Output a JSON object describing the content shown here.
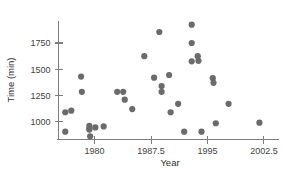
{
  "chart_data": {
    "type": "scatter",
    "title": "",
    "xlabel": "Year",
    "ylabel": "Time (min)",
    "xlim": [
      1975.2,
      2004.5
    ],
    "ylim": [
      830,
      1960
    ],
    "xticks": [
      1980,
      1987.5,
      1995,
      2002.5
    ],
    "xticklabels": [
      "1980",
      "1987.5",
      "1995",
      "2002.5"
    ],
    "yticks": [
      1000,
      1250,
      1500,
      1750
    ],
    "yticklabels": [
      "1000",
      "1250",
      "1500",
      "1750"
    ],
    "grid": false,
    "legend": null,
    "marker": {
      "shape": "circle",
      "color": "#6b6b6b",
      "size": 3.1
    },
    "points": [
      {
        "x": 1976.1,
        "y": 1090
      },
      {
        "x": 1976.1,
        "y": 905
      },
      {
        "x": 1976.9,
        "y": 1105
      },
      {
        "x": 1978.2,
        "y": 1430
      },
      {
        "x": 1978.3,
        "y": 1285
      },
      {
        "x": 1979.3,
        "y": 960
      },
      {
        "x": 1979.3,
        "y": 935
      },
      {
        "x": 1979.3,
        "y": 925
      },
      {
        "x": 1979.4,
        "y": 860
      },
      {
        "x": 1980.1,
        "y": 945
      },
      {
        "x": 1981.2,
        "y": 955
      },
      {
        "x": 1983.0,
        "y": 1285
      },
      {
        "x": 1983.8,
        "y": 1285
      },
      {
        "x": 1984.0,
        "y": 1210
      },
      {
        "x": 1985.0,
        "y": 1120
      },
      {
        "x": 1986.6,
        "y": 1625
      },
      {
        "x": 1987.9,
        "y": 1420
      },
      {
        "x": 1988.6,
        "y": 1855
      },
      {
        "x": 1988.9,
        "y": 1340
      },
      {
        "x": 1988.9,
        "y": 1285
      },
      {
        "x": 1989.9,
        "y": 1445
      },
      {
        "x": 1990.1,
        "y": 1090
      },
      {
        "x": 1991.1,
        "y": 1170
      },
      {
        "x": 1991.9,
        "y": 905
      },
      {
        "x": 1992.9,
        "y": 1925
      },
      {
        "x": 1992.9,
        "y": 1750
      },
      {
        "x": 1992.9,
        "y": 1575
      },
      {
        "x": 1993.7,
        "y": 1625
      },
      {
        "x": 1993.8,
        "y": 1580
      },
      {
        "x": 1994.2,
        "y": 905
      },
      {
        "x": 1995.7,
        "y": 1415
      },
      {
        "x": 1995.8,
        "y": 1370
      },
      {
        "x": 1996.1,
        "y": 985
      },
      {
        "x": 1997.8,
        "y": 1170
      },
      {
        "x": 2001.9,
        "y": 990
      }
    ]
  },
  "axes": {
    "y_axis_label": "Time (min)",
    "x_axis_label": "Year"
  }
}
